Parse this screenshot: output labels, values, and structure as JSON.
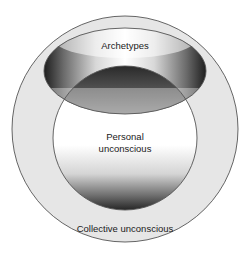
{
  "diagram": {
    "type": "nested-circles",
    "labels": {
      "archetypes": "Archetypes",
      "personal_line1": "Personal",
      "personal_line2": "unconscious",
      "collective": "Collective unconscious"
    },
    "colors": {
      "background": "#ffffff",
      "collective_fill": "#e6e6e6",
      "stroke": "#555555",
      "shadow_dark": "#2a2a2a",
      "highlight": "#ffffff"
    }
  }
}
